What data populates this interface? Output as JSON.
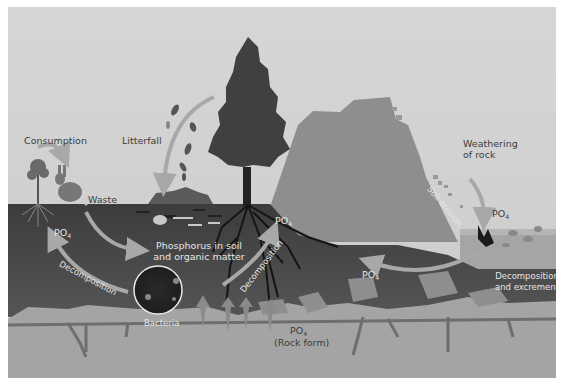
{
  "diagram": {
    "labels": {
      "consumption": "Consumption",
      "litterfall": "Litterfall",
      "waste": "Waste",
      "weathering_line1": "Weathering",
      "weathering_line2": "of rock",
      "soil_erosion": "Soil erosion",
      "po4_left": "PO",
      "po4_tree": "PO",
      "po4_middle": "PO",
      "po4_water": "PO",
      "po4_rock": "PO",
      "subscript": "4",
      "rock_form": "(Rock form)",
      "phosphorus_soil_line1": "Phosphorus in soil",
      "phosphorus_soil_line2": "and organic matter",
      "decomposition_left": "Decomposition",
      "decomposition_tree": "Decomposition",
      "bacteria": "Bacteria",
      "decomp_excrement_line1": "Decomposition",
      "decomp_excrement_line2": "and excrement"
    },
    "colors": {
      "sky": "#d3d3d3",
      "mountain": "#8c8c8c",
      "soil": "#4a4a4a",
      "bedrock": "#a4a4a4",
      "water": "#9a9a9a",
      "tree": "#3a3a3a",
      "arrow": "#9e9e9e"
    }
  }
}
